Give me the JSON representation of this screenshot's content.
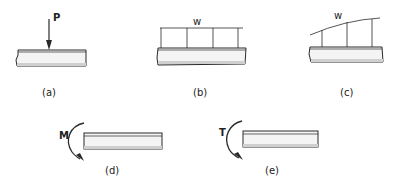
{
  "colors": {
    "ink": "#2a2a2a",
    "beam_fill": "#f4f4f4",
    "beam_shade": "#cfcfcf",
    "background": "#ffffff"
  },
  "panels": [
    {
      "id": "a",
      "caption": "(a)",
      "load_type": "concentrated load",
      "symbol": "P"
    },
    {
      "id": "b",
      "caption": "(b)",
      "load_type": "uniformly distributed load",
      "symbol": "w"
    },
    {
      "id": "c",
      "caption": "(c)",
      "load_type": "varying distributed load",
      "symbol": "w"
    },
    {
      "id": "d",
      "caption": "(d)",
      "load_type": "bending moment",
      "symbol": "M"
    },
    {
      "id": "e",
      "caption": "(e)",
      "load_type": "torque",
      "symbol": "T"
    }
  ]
}
